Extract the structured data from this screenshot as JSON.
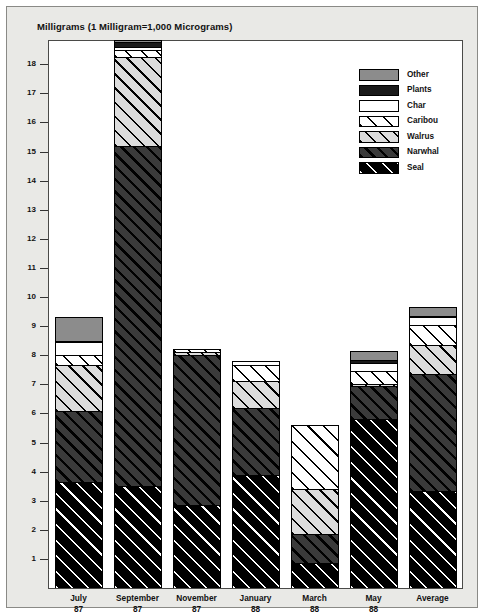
{
  "chart": {
    "title": "Milligrams (1 Milligram=1,000 Micrograms)"
  },
  "legend": {
    "position": "top-right",
    "items": [
      {
        "label": "Other",
        "key": "other",
        "pattern": "solid-gray",
        "color": "#8c8c8c"
      },
      {
        "label": "Plants",
        "key": "plants",
        "pattern": "solid-black",
        "color": "#1a1a1a"
      },
      {
        "label": "Char",
        "key": "char",
        "pattern": "solid-white",
        "color": "#ffffff"
      },
      {
        "label": "Caribou",
        "key": "caribou",
        "pattern": "white-diagonal",
        "color": "#ffffff"
      },
      {
        "label": "Walrus",
        "key": "walrus",
        "pattern": "lightgray-diagonal",
        "color": "#dcdcdc"
      },
      {
        "label": "Narwhal",
        "key": "narwhal",
        "pattern": "darkgray-diagonal",
        "color": "#3a3a3a"
      },
      {
        "label": "Seal",
        "key": "seal",
        "pattern": "black-diagonal",
        "color": "#000000"
      }
    ]
  },
  "axis": {
    "y_ticks": [
      18,
      17,
      16,
      15,
      14,
      13,
      12,
      11,
      10,
      9,
      8,
      7,
      6,
      5,
      4,
      3,
      2,
      1,
      0
    ],
    "y_tick_labels": [
      "18",
      "17",
      "16",
      "15",
      "14",
      "13",
      "12",
      "11",
      "10",
      "9",
      "8",
      "7",
      "6",
      "5",
      "4",
      "3",
      "2",
      "1",
      "0"
    ],
    "x_labels": [
      {
        "line1": "July",
        "line2": "87"
      },
      {
        "line1": "September",
        "line2": "87"
      },
      {
        "line1": "November",
        "line2": "87"
      },
      {
        "line1": "January",
        "line2": "88"
      },
      {
        "line1": "March",
        "line2": "88"
      },
      {
        "line1": "May",
        "line2": "88"
      },
      {
        "line1": "Average",
        "line2": ""
      }
    ]
  },
  "chart_data": {
    "type": "bar",
    "subtype": "stacked",
    "title": "Milligrams (1 Milligram=1,000 Micrograms)",
    "xlabel": "",
    "ylabel": "Milligrams",
    "ylim": [
      0,
      18.8
    ],
    "grid": false,
    "legend_position": "top-right",
    "categories": [
      "July 87",
      "September 87",
      "November 87",
      "January 88",
      "March 88",
      "May 88",
      "Average"
    ],
    "stack_order_bottom_to_top": [
      "Seal",
      "Narwhal",
      "Walrus",
      "Caribou",
      "Char",
      "Plants",
      "Other"
    ],
    "series": [
      {
        "name": "Seal",
        "values": [
          3.65,
          3.5,
          2.85,
          3.9,
          0.85,
          5.8,
          3.35
        ]
      },
      {
        "name": "Narwhal",
        "values": [
          2.45,
          11.7,
          5.15,
          2.3,
          1.0,
          1.15,
          4.0
        ]
      },
      {
        "name": "Walrus",
        "values": [
          1.55,
          3.05,
          0.1,
          0.9,
          1.55,
          0.05,
          1.0
        ]
      },
      {
        "name": "Caribou",
        "values": [
          0.35,
          0.25,
          0.1,
          0.55,
          2.2,
          0.45,
          0.7
        ]
      },
      {
        "name": "Char",
        "values": [
          0.45,
          0.1,
          0.0,
          0.15,
          0.0,
          0.3,
          0.25
        ]
      },
      {
        "name": "Plants",
        "values": [
          0.05,
          0.15,
          0.0,
          0.0,
          0.0,
          0.1,
          0.05
        ]
      },
      {
        "name": "Other",
        "values": [
          0.8,
          0.1,
          0.0,
          0.0,
          0.0,
          0.3,
          0.3
        ]
      }
    ],
    "totals": [
      9.3,
      18.85,
      8.2,
      7.8,
      5.6,
      8.15,
      9.65
    ]
  }
}
